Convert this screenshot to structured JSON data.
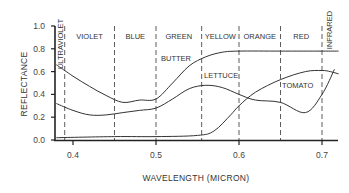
{
  "chart_data": {
    "type": "line",
    "title": "",
    "xlabel": "WAVELENGTH (MICRON)",
    "ylabel": "REFLECTANCE",
    "xlim": [
      0.38,
      0.72
    ],
    "ylim": [
      0.0,
      1.0
    ],
    "grid": false,
    "legend": "inline labels",
    "x_ticks": [
      "0.4",
      "0.5",
      "0.6",
      "0.7"
    ],
    "y_ticks": [
      "0.0",
      "0.2",
      "0.4",
      "0.6",
      "0.8",
      "1.0"
    ],
    "bands": [
      {
        "label": "ULTRAVIOLET",
        "from": 0.38,
        "to": 0.39,
        "vertical": true
      },
      {
        "label": "VIOLET",
        "from": 0.39,
        "to": 0.45
      },
      {
        "label": "BLUE",
        "from": 0.45,
        "to": 0.5
      },
      {
        "label": "GREEN",
        "from": 0.5,
        "to": 0.555
      },
      {
        "label": "YELLOW",
        "from": 0.555,
        "to": 0.6
      },
      {
        "label": "ORANGE",
        "from": 0.6,
        "to": 0.65
      },
      {
        "label": "RED",
        "from": 0.65,
        "to": 0.7
      },
      {
        "label": "INFRARED",
        "from": 0.7,
        "to": 0.72,
        "vertical": true
      }
    ],
    "series": [
      {
        "name": "BUTTER",
        "x": [
          0.38,
          0.4,
          0.42,
          0.44,
          0.46,
          0.48,
          0.5,
          0.52,
          0.54,
          0.56,
          0.58,
          0.6,
          0.65,
          0.7,
          0.72
        ],
        "values": [
          0.66,
          0.56,
          0.47,
          0.39,
          0.33,
          0.35,
          0.36,
          0.5,
          0.65,
          0.73,
          0.77,
          0.78,
          0.78,
          0.78,
          0.78
        ]
      },
      {
        "name": "LETTUCE",
        "x": [
          0.38,
          0.4,
          0.42,
          0.44,
          0.46,
          0.48,
          0.5,
          0.52,
          0.54,
          0.56,
          0.58,
          0.6,
          0.62,
          0.65,
          0.68,
          0.7,
          0.715
        ],
        "values": [
          0.32,
          0.26,
          0.22,
          0.22,
          0.24,
          0.26,
          0.28,
          0.36,
          0.45,
          0.48,
          0.46,
          0.4,
          0.35,
          0.33,
          0.24,
          0.4,
          0.62
        ]
      },
      {
        "name": "TOMATO",
        "x": [
          0.38,
          0.45,
          0.5,
          0.55,
          0.57,
          0.59,
          0.6,
          0.62,
          0.65,
          0.68,
          0.7,
          0.71,
          0.72
        ],
        "values": [
          0.02,
          0.03,
          0.03,
          0.04,
          0.08,
          0.22,
          0.3,
          0.42,
          0.53,
          0.6,
          0.61,
          0.6,
          0.58
        ]
      }
    ]
  }
}
